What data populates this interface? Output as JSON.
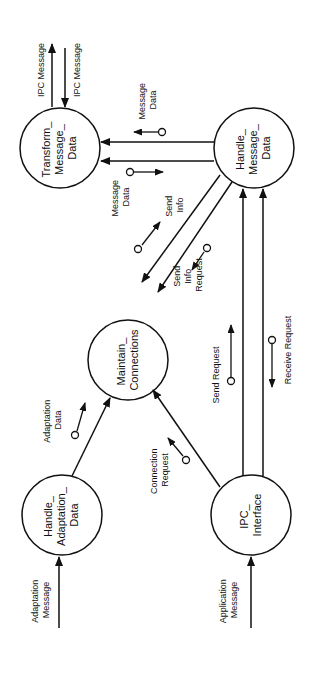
{
  "diagram": {
    "type": "data-flow-diagram",
    "orientation": "rotated-90-ccw",
    "stroke_color": "#111111",
    "background": "#ffffff",
    "nodes": [
      {
        "id": "transform",
        "lines": [
          "Transform_",
          "Message_",
          "Data"
        ],
        "cx": 60,
        "cy": 148,
        "r": 40
      },
      {
        "id": "handle_message",
        "lines": [
          "Handle_",
          "Message_",
          "Data"
        ],
        "cx": 254,
        "cy": 148,
        "r": 40
      },
      {
        "id": "maintain",
        "lines": [
          "Maintain_",
          "Connections"
        ],
        "cx": 128,
        "cy": 360,
        "r": 40
      },
      {
        "id": "handle_adaptation",
        "lines": [
          "Handle_",
          "Adaptation_",
          "Data"
        ],
        "cx": 62,
        "cy": 515,
        "r": 40
      },
      {
        "id": "ipc_interface",
        "lines": [
          "IPC_",
          "Interface"
        ],
        "cx": 251,
        "cy": 515,
        "r": 40
      }
    ],
    "flows": [
      {
        "id": "ipc_out",
        "label": [
          "IPC Message"
        ],
        "from": "transform",
        "to": "external",
        "direction": "out"
      },
      {
        "id": "ipc_in",
        "label": [
          "IPC Message"
        ],
        "from": "external",
        "to": "transform",
        "direction": "in"
      },
      {
        "id": "msg_data_1",
        "label": [
          "Message",
          "Data"
        ],
        "from": "handle_message",
        "to": "transform",
        "couple": "data"
      },
      {
        "id": "msg_data_2",
        "label": [
          "Message",
          "Data"
        ],
        "from": "handle_message",
        "to": "transform",
        "couple": "data"
      },
      {
        "id": "send_info",
        "label": [
          "Send",
          "Info"
        ],
        "from": "handle_message",
        "to": "maintain",
        "couple": "data"
      },
      {
        "id": "send_info_request",
        "label": [
          "Send",
          "Info",
          "Request"
        ],
        "from": "handle_message",
        "to": "maintain",
        "couple": "data"
      },
      {
        "id": "adaptation_data",
        "label": [
          "Adaptation",
          "Data"
        ],
        "from": "handle_adaptation",
        "to": "maintain",
        "couple": "data"
      },
      {
        "id": "connection_request",
        "label": [
          "Connection",
          "Request"
        ],
        "from": "ipc_interface",
        "to": "maintain",
        "couple": "data"
      },
      {
        "id": "send_request",
        "label": [
          "Send Request"
        ],
        "from": "ipc_interface",
        "to": "handle_message",
        "couple": "data"
      },
      {
        "id": "receive_request",
        "label": [
          "Receive Request"
        ],
        "from": "ipc_interface",
        "to": "handle_message",
        "couple": "data"
      },
      {
        "id": "adaptation_message",
        "label": [
          "Adaptation",
          "Message"
        ],
        "from": "external",
        "to": "handle_adaptation"
      },
      {
        "id": "application_message",
        "label": [
          "Application",
          "Message"
        ],
        "from": "external",
        "to": "ipc_interface"
      }
    ]
  },
  "labels": {
    "transform": {
      "l1": "Transform_",
      "l2": "Message_",
      "l3": "Data"
    },
    "handle_message": {
      "l1": "Handle_",
      "l2": "Message_",
      "l3": "Data"
    },
    "maintain": {
      "l1": "Maintain_",
      "l2": "Connections"
    },
    "handle_adaptation": {
      "l1": "Handle_",
      "l2": "Adaptation_",
      "l3": "Data"
    },
    "ipc_interface": {
      "l1": "IPC_",
      "l2": "Interface"
    },
    "ipc_out": "IPC Message",
    "ipc_in": "IPC Message",
    "msg_data_top": {
      "l1": "Message",
      "l2": "Data"
    },
    "msg_data_bottom": {
      "l1": "Message",
      "l2": "Data"
    },
    "send_info": {
      "l1": "Send",
      "l2": "Info"
    },
    "send_info_request": {
      "l1": "Send",
      "l2": "Info",
      "l3": "Request"
    },
    "adaptation_data": {
      "l1": "Adaptation",
      "l2": "Data"
    },
    "connection_request": {
      "l1": "Connection",
      "l2": "Request"
    },
    "send_request": "Send Request",
    "receive_request": "Receive Request",
    "adaptation_message": {
      "l1": "Adaptation",
      "l2": "Message"
    },
    "application_message": {
      "l1": "Application",
      "l2": "Message"
    }
  }
}
